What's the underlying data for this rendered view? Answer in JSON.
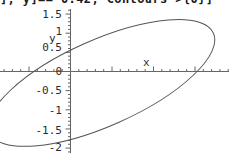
{
  "code": {
    "visible_text": "], y]== 0.42, Contours->{0}]"
  },
  "chart_data": {
    "type": "line",
    "title": "",
    "subtitle": "",
    "xlabel": "x",
    "ylabel": "y",
    "grid": false,
    "legend": null,
    "xlim": [
      -3.0,
      4.6
    ],
    "ylim": [
      -2.15,
      1.62
    ],
    "x_tick_labels": [],
    "y_tick_labels": [
      "1.5",
      "1",
      "0.5",
      "0",
      "-0.5",
      "-1",
      "-1.5",
      "-2"
    ],
    "y_tick_values": [
      1.5,
      1,
      0.5,
      0,
      -0.5,
      -1,
      -1.5,
      -2
    ],
    "y_minor_tick_step": 0.1,
    "x_major_tick_step": 1,
    "x_minor_tick_step": 0.2,
    "series": [
      {
        "name": "contour-level-0",
        "shape": "ellipse",
        "center_x": 0.75,
        "center_y": -0.3,
        "semi_major": 2.95,
        "semi_minor": 1.12,
        "rotation_deg": -24,
        "color": "#555555",
        "line_width": 1
      }
    ],
    "annotations": [
      {
        "text": "y",
        "x": -0.62,
        "y": 0.72
      },
      {
        "text": "x",
        "x": 1.72,
        "y": 0.17
      }
    ]
  },
  "axes": {
    "x_axis_color": "#666666",
    "y_axis_color": "#666666",
    "curve_color": "#555555",
    "background": "#ffffff",
    "text_color": "#2b2b2b"
  }
}
